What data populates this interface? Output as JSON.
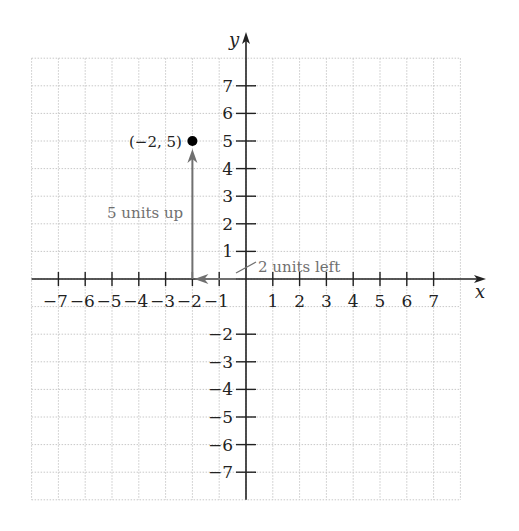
{
  "chart_data": {
    "type": "scatter",
    "title": "",
    "xlabel": "x",
    "ylabel": "y",
    "xlim": [
      -8,
      8
    ],
    "ylim": [
      -8,
      8
    ],
    "grid": true,
    "x_ticks": [
      -7,
      -6,
      -5,
      -4,
      -3,
      -2,
      -1,
      1,
      2,
      3,
      4,
      5,
      6,
      7
    ],
    "y_ticks": [
      -7,
      -6,
      -5,
      -4,
      -3,
      -2,
      1,
      2,
      3,
      4,
      5,
      6,
      7
    ],
    "x_tick_labels": [
      "−7",
      "−6",
      "−5",
      "−4",
      "−3",
      "−2",
      "−1",
      "1",
      "2",
      "3",
      "4",
      "5",
      "6",
      "7"
    ],
    "y_tick_labels": [
      "−7",
      "−6",
      "−5",
      "−4",
      "−3",
      "−2",
      "1",
      "2",
      "3",
      "4",
      "5",
      "6",
      "7"
    ],
    "points": [
      {
        "x": -2,
        "y": 5,
        "label": "(−2, 5)"
      }
    ],
    "annotations": [
      {
        "text": "2 units left",
        "type": "arrow",
        "from": [
          0,
          0
        ],
        "to": [
          -2,
          0
        ]
      },
      {
        "text": "5 units up",
        "type": "arrow",
        "from": [
          -2,
          0
        ],
        "to": [
          -2,
          5
        ]
      }
    ]
  },
  "labels": {
    "x_axis": "x",
    "y_axis": "y",
    "point": "(−2, 5)",
    "up": "5 units up",
    "left": "2 units left"
  },
  "colors": {
    "axis": "#222222",
    "grid": "#c8c8c8",
    "annotation": "#707070",
    "point": "#000000"
  }
}
